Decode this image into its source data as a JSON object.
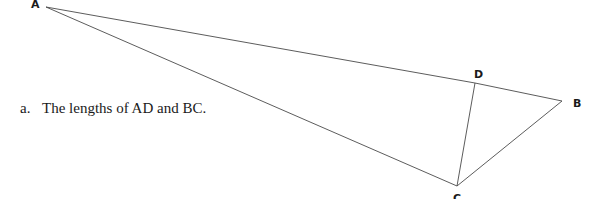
{
  "diagram": {
    "vertices": {
      "A": {
        "label": "A",
        "x": 46,
        "y": 7,
        "lx": 31,
        "ly": 8
      },
      "B": {
        "label": "B",
        "x": 562,
        "y": 101,
        "lx": 573,
        "ly": 107
      },
      "C": {
        "label": "C",
        "x": 457,
        "y": 186,
        "lx": 453,
        "ly": 202
      },
      "D": {
        "label": "D",
        "x": 475,
        "y": 83,
        "lx": 474,
        "ly": 78
      }
    },
    "edges": [
      [
        "A",
        "D"
      ],
      [
        "D",
        "B"
      ],
      [
        "A",
        "C"
      ],
      [
        "D",
        "C"
      ],
      [
        "C",
        "B"
      ]
    ]
  },
  "question": {
    "number": "a.",
    "text": "The lengths of AD and BC."
  }
}
